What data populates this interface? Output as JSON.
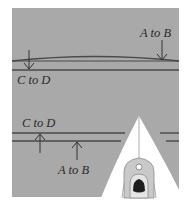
{
  "diagram": {
    "colors": {
      "water": "#a9a9a9",
      "line": "#4a4a4a",
      "boat_white": "#ffffff",
      "boat_deck": "#c9c9c9",
      "cockpit": "#1e1e1e",
      "background": "#ffffff"
    },
    "top_panel": {
      "label_a_to_b": "A to B",
      "label_c_to_d": "C to D"
    },
    "bottom_panel": {
      "label_c_to_d": "C to D",
      "label_a_to_b": "A to B"
    }
  }
}
